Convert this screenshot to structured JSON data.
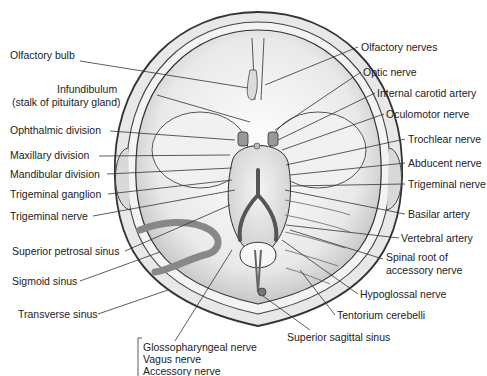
{
  "figure": {
    "labels_left": [
      {
        "id": "olfactory-bulb",
        "text": "Olfactory bulb",
        "x": 10,
        "y": 55
      },
      {
        "id": "infundibulum",
        "text": "Infundibulum",
        "x": 57,
        "y": 89
      },
      {
        "id": "infundibulum-sub",
        "text": "(stalk of pituitary gland)",
        "x": 12,
        "y": 102
      },
      {
        "id": "ophthalmic-division",
        "text": "Ophthalmic division",
        "x": 10,
        "y": 125
      },
      {
        "id": "maxillary-division",
        "text": "Maxillary division",
        "x": 10,
        "y": 150
      },
      {
        "id": "mandibular-division",
        "text": "Mandibular division",
        "x": 10,
        "y": 168
      },
      {
        "id": "trigeminal-ganglion",
        "text": "Trigeminal ganglion",
        "x": 10,
        "y": 188
      },
      {
        "id": "trigeminal-nerve-left",
        "text": "Trigeminal nerve",
        "x": 10,
        "y": 210
      },
      {
        "id": "superior-petrosal-sinus",
        "text": "Superior petrosal sinus",
        "x": 12,
        "y": 245
      },
      {
        "id": "sigmoid-sinus",
        "text": "Sigmoid sinus",
        "x": 12,
        "y": 275
      },
      {
        "id": "transverse-sinus",
        "text": "Transverse sinus",
        "x": 18,
        "y": 308
      }
    ],
    "labels_right": [
      {
        "id": "olfactory-nerves",
        "text": "Olfactory nerves",
        "x": 361,
        "y": 41
      },
      {
        "id": "optic-nerve",
        "text": "Optic nerve",
        "x": 363,
        "y": 66
      },
      {
        "id": "internal-carotid-artery",
        "text": "Internal carotid artery",
        "x": 377,
        "y": 87
      },
      {
        "id": "oculomotor-nerve",
        "text": "Oculomotor nerve",
        "x": 386,
        "y": 108
      },
      {
        "id": "trochlear-nerve",
        "text": "Trochlear nerve",
        "x": 408,
        "y": 133
      },
      {
        "id": "abducent-nerve",
        "text": "Abducent nerve",
        "x": 408,
        "y": 157
      },
      {
        "id": "trigeminal-nerve-right",
        "text": "Trigeminal nerve",
        "x": 408,
        "y": 178
      },
      {
        "id": "basilar-artery",
        "text": "Basilar artery",
        "x": 408,
        "y": 208
      },
      {
        "id": "vertebral-artery",
        "text": "Vertebral artery",
        "x": 401,
        "y": 232
      },
      {
        "id": "spinal-root-accessory",
        "text": "Spinal root of",
        "x": 386,
        "y": 251
      },
      {
        "id": "spinal-root-accessory-sub",
        "text": "accessory nerve",
        "x": 386,
        "y": 264
      },
      {
        "id": "hypoglossal-nerve",
        "text": "Hypoglossal nerve",
        "x": 360,
        "y": 288
      },
      {
        "id": "tentorium-cerebelli",
        "text": "Tentorium cerebelli",
        "x": 337,
        "y": 309
      }
    ],
    "labels_bottom": [
      {
        "id": "superior-sagittal-sinus",
        "text": "Superior sagittal sinus",
        "x": 287,
        "y": 331
      },
      {
        "id": "glossopharyngeal-nerve",
        "text": "Glossopharyngeal nerve",
        "x": 143,
        "y": 343
      },
      {
        "id": "vagus-nerve",
        "text": "Vagus nerve",
        "x": 143,
        "y": 355
      },
      {
        "id": "accessory-nerve",
        "text": "Accessory nerve",
        "x": 143,
        "y": 367
      }
    ]
  }
}
